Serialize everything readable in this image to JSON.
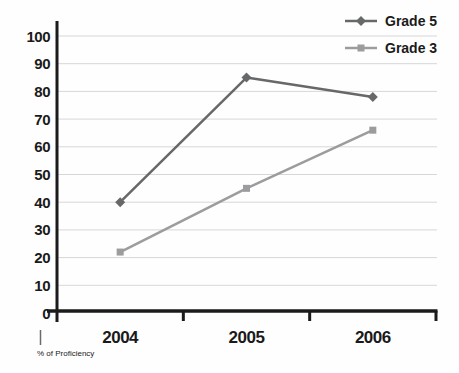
{
  "chart_data": {
    "type": "line",
    "categories": [
      "2004",
      "2005",
      "2006"
    ],
    "series": [
      {
        "name": "Grade 5",
        "values": [
          40,
          85,
          78
        ],
        "color": "#66686a",
        "marker": "diamond"
      },
      {
        "name": "Grade 3",
        "values": [
          22,
          45,
          66
        ],
        "color": "#9c9c9e",
        "marker": "square"
      }
    ],
    "title": "",
    "xlabel": "",
    "ylabel": "% of Proficiency",
    "ylim": [
      0,
      100
    ],
    "ytick_step": 10,
    "grid": true,
    "legend_position": "top-right",
    "colors": {
      "axis": "#1b1b1b",
      "gridline": "#d7d7d7",
      "label": "#1a1a1a",
      "note": "#3f3f3f",
      "note_tick": "#6b6b6b",
      "background": "#fefefe"
    }
  }
}
